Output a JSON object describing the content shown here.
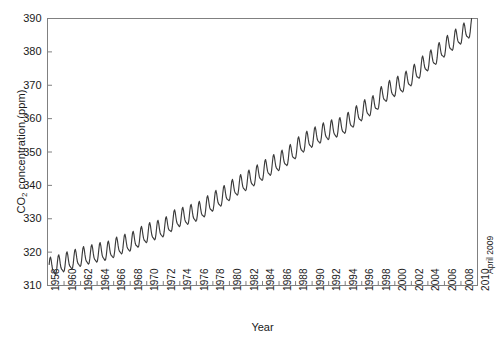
{
  "chart_data": {
    "type": "line",
    "title": "",
    "subtitle": "",
    "xlabel": "Year",
    "ylabel": "CO2 concentration (ppm)",
    "ylabel_display": "CO",
    "ylabel_sub": "2",
    "ylabel_rest": " concentration (ppm)",
    "xlim": [
      1958,
      2010
    ],
    "ylim": [
      310,
      390
    ],
    "grid": false,
    "legend": null,
    "line_color": "#3b3b3b",
    "axis_color": "#808080",
    "annotations": [
      {
        "text": "April 2009",
        "x": 2009.3,
        "y": 320,
        "rotation": 90
      }
    ],
    "yticks": [
      310,
      320,
      330,
      340,
      350,
      360,
      370,
      380,
      390
    ],
    "ytick_labels": [
      "310",
      "320",
      "330",
      "340",
      "350",
      "360",
      "370",
      "380",
      "390"
    ],
    "xticks": [
      1958,
      1960,
      1962,
      1964,
      1966,
      1968,
      1970,
      1972,
      1974,
      1976,
      1978,
      1980,
      1982,
      1984,
      1986,
      1988,
      1990,
      1992,
      1994,
      1996,
      1998,
      2000,
      2002,
      2004,
      2006,
      2008,
      2010
    ],
    "xtick_labels": [
      "1958",
      "1960",
      "1962",
      "1964",
      "1966",
      "1968",
      "1970",
      "1972",
      "1974",
      "1976",
      "1978",
      "1980",
      "1982",
      "1984",
      "1986",
      "1988",
      "1990",
      "1992",
      "1994",
      "1996",
      "1998",
      "2000",
      "2002",
      "2004",
      "2006",
      "2008",
      "2010"
    ],
    "series": [
      {
        "name": "Mauna Loa monthly mean CO2",
        "description": "Monthly mean atmospheric CO2 concentration with seasonal cycle, March 1958 - April 2009",
        "x_start": 1958.2,
        "x_end": 2009.3,
        "trend_annual": [
          {
            "year": 1958,
            "value": 315.3
          },
          {
            "year": 1959,
            "value": 315.98
          },
          {
            "year": 1960,
            "value": 316.91
          },
          {
            "year": 1961,
            "value": 317.64
          },
          {
            "year": 1962,
            "value": 318.45
          },
          {
            "year": 1963,
            "value": 318.99
          },
          {
            "year": 1964,
            "value": 319.62
          },
          {
            "year": 1965,
            "value": 320.04
          },
          {
            "year": 1966,
            "value": 321.38
          },
          {
            "year": 1967,
            "value": 322.16
          },
          {
            "year": 1968,
            "value": 323.04
          },
          {
            "year": 1969,
            "value": 324.62
          },
          {
            "year": 1970,
            "value": 325.68
          },
          {
            "year": 1971,
            "value": 326.32
          },
          {
            "year": 1972,
            "value": 327.45
          },
          {
            "year": 1973,
            "value": 329.68
          },
          {
            "year": 1974,
            "value": 330.18
          },
          {
            "year": 1975,
            "value": 331.11
          },
          {
            "year": 1976,
            "value": 332.04
          },
          {
            "year": 1977,
            "value": 333.83
          },
          {
            "year": 1978,
            "value": 335.4
          },
          {
            "year": 1979,
            "value": 336.84
          },
          {
            "year": 1980,
            "value": 338.75
          },
          {
            "year": 1981,
            "value": 340.11
          },
          {
            "year": 1982,
            "value": 341.45
          },
          {
            "year": 1983,
            "value": 343.05
          },
          {
            "year": 1984,
            "value": 344.65
          },
          {
            "year": 1985,
            "value": 346.12
          },
          {
            "year": 1986,
            "value": 347.42
          },
          {
            "year": 1987,
            "value": 349.19
          },
          {
            "year": 1988,
            "value": 351.57
          },
          {
            "year": 1989,
            "value": 353.12
          },
          {
            "year": 1990,
            "value": 354.39
          },
          {
            "year": 1991,
            "value": 355.61
          },
          {
            "year": 1992,
            "value": 356.45
          },
          {
            "year": 1993,
            "value": 357.1
          },
          {
            "year": 1994,
            "value": 358.83
          },
          {
            "year": 1995,
            "value": 360.82
          },
          {
            "year": 1996,
            "value": 362.61
          },
          {
            "year": 1997,
            "value": 363.73
          },
          {
            "year": 1998,
            "value": 366.7
          },
          {
            "year": 1999,
            "value": 368.38
          },
          {
            "year": 2000,
            "value": 369.55
          },
          {
            "year": 2001,
            "value": 371.14
          },
          {
            "year": 2002,
            "value": 373.28
          },
          {
            "year": 2003,
            "value": 375.8
          },
          {
            "year": 2004,
            "value": 377.52
          },
          {
            "year": 2005,
            "value": 379.8
          },
          {
            "year": 2006,
            "value": 381.9
          },
          {
            "year": 2007,
            "value": 383.79
          },
          {
            "year": 2008,
            "value": 385.6
          },
          {
            "year": 2009,
            "value": 387.43
          }
        ],
        "seasonal_amplitude_ppm": 6.2,
        "seasonal_peak_month": "May",
        "seasonal_trough_month": "October",
        "start_value_ppm": 315.7,
        "end_value_ppm": 389.6,
        "min_value_ppm": 312.7,
        "max_value_ppm": 389.6
      }
    ]
  },
  "figure": {
    "background_color": "#ffffff",
    "x_axis_title": "Year",
    "end_annotation": "April 2009"
  }
}
